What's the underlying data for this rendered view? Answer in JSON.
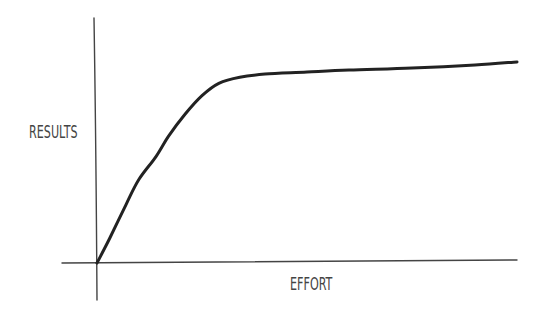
{
  "chart_data": {
    "type": "line",
    "title": "",
    "xlabel": "EFFORT",
    "ylabel": "RESULTS",
    "grid": false,
    "legend": null,
    "ticks": {
      "x": [],
      "y": []
    },
    "style": "hand-drawn sketch, diminishing returns curve",
    "series": [
      {
        "name": "results",
        "description": "Steep rise then plateau (diminishing returns)",
        "points": [
          [
            0,
            0
          ],
          [
            0.03,
            0.12
          ],
          [
            0.07,
            0.29
          ],
          [
            0.1,
            0.41
          ],
          [
            0.14,
            0.52
          ],
          [
            0.17,
            0.62
          ],
          [
            0.21,
            0.73
          ],
          [
            0.25,
            0.82
          ],
          [
            0.29,
            0.88
          ],
          [
            0.34,
            0.91
          ],
          [
            0.4,
            0.925
          ],
          [
            0.5,
            0.935
          ],
          [
            0.6,
            0.945
          ],
          [
            0.75,
            0.955
          ],
          [
            0.9,
            0.97
          ],
          [
            1.0,
            0.985
          ]
        ]
      }
    ],
    "xlim": [
      0,
      1
    ],
    "ylim": [
      0,
      1.2
    ]
  },
  "colors": {
    "curve": "#222222",
    "axes": "#444444",
    "text": "#444444",
    "background": "#ffffff"
  }
}
